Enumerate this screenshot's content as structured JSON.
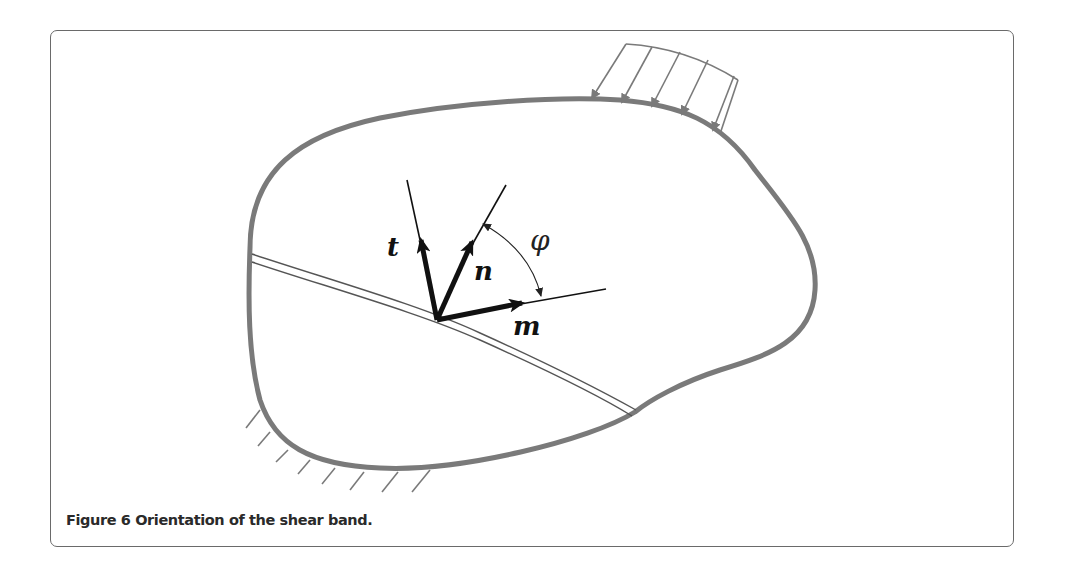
{
  "figure": {
    "caption": "Figure 6 Orientation of the shear band.",
    "label_number": "Figure 6",
    "caption_text": "Orientation of the shear band.",
    "labels": {
      "t": "t",
      "n": "n",
      "m": "m",
      "phi": "φ"
    },
    "colors": {
      "body_outline": "#7a7a7a",
      "vectors": "#111111",
      "load_arrows": "#7a7a7a",
      "frame": "#6a6a6a",
      "caption": "#2a2a2a"
    },
    "elements": {
      "body": "deformable body outline",
      "shear_band": "double-line shear band",
      "distributed_load": "5 distributed load arrows",
      "fixed_support": "hatched fixed support",
      "vectors": [
        "t",
        "n",
        "m"
      ],
      "angle": "φ between n and m"
    }
  }
}
